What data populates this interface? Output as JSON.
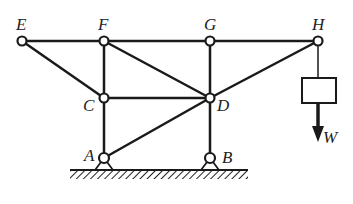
{
  "diagram": {
    "type": "truss",
    "nodes": [
      {
        "id": "E",
        "label": "E",
        "x": 22,
        "y": 41
      },
      {
        "id": "F",
        "label": "F",
        "x": 104,
        "y": 41
      },
      {
        "id": "G",
        "label": "G",
        "x": 210,
        "y": 41
      },
      {
        "id": "H",
        "label": "H",
        "x": 318,
        "y": 41
      },
      {
        "id": "C",
        "label": "C",
        "x": 104,
        "y": 98
      },
      {
        "id": "D",
        "label": "D",
        "x": 210,
        "y": 98
      },
      {
        "id": "A",
        "label": "A",
        "x": 104,
        "y": 158
      },
      {
        "id": "B",
        "label": "B",
        "x": 210,
        "y": 158
      }
    ],
    "members": [
      [
        "E",
        "F"
      ],
      [
        "F",
        "G"
      ],
      [
        "G",
        "H"
      ],
      [
        "E",
        "C"
      ],
      [
        "F",
        "C"
      ],
      [
        "F",
        "D"
      ],
      [
        "G",
        "D"
      ],
      [
        "H",
        "D"
      ],
      [
        "C",
        "D"
      ],
      [
        "C",
        "A"
      ],
      [
        "A",
        "D"
      ],
      [
        "D",
        "B"
      ]
    ],
    "supports": [
      {
        "node": "A",
        "type": "pin"
      },
      {
        "node": "B",
        "type": "pin"
      }
    ],
    "load": {
      "node": "H",
      "label": "W",
      "direction": "down"
    },
    "colors": {
      "line": "#1a1a1a",
      "background": "#ffffff"
    }
  }
}
